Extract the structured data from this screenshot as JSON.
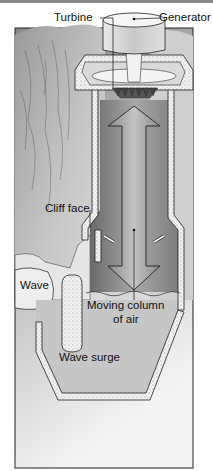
{
  "diagram": {
    "labels": {
      "turbine": "Turbine",
      "generator": "Generator",
      "cliff_face": "Cliff face",
      "wave": "Wave",
      "moving_column_line1": "Moving column",
      "moving_column_line2": "of air",
      "wave_surge": "Wave surge"
    },
    "colors": {
      "rock": "#b8b8b8",
      "chamber_air": "#8e8e8e",
      "water": "#c9c9c9",
      "wall": "#ffffff",
      "outline": "#222222"
    }
  }
}
